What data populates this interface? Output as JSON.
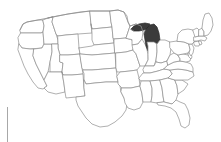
{
  "page": {
    "background_color": "#ffffff"
  },
  "map": {
    "name": "united-states-locator-map",
    "projection_hint": "albers-usa",
    "border_color": "#8e8e8e",
    "state_fill_color": "#ffffff",
    "highlight_fill_color": "#3b3b3b",
    "highlight_border_color": "#2a2a2a",
    "highlighted_states": [
      "Michigan"
    ],
    "highlight_label": "Michigan",
    "states": [
      "Washington",
      "Oregon",
      "California",
      "Nevada",
      "Idaho",
      "Montana",
      "Wyoming",
      "Utah",
      "Arizona",
      "Colorado",
      "New Mexico",
      "North Dakota",
      "South Dakota",
      "Nebraska",
      "Kansas",
      "Oklahoma",
      "Texas",
      "Minnesota",
      "Iowa",
      "Missouri",
      "Arkansas",
      "Louisiana",
      "Wisconsin",
      "Illinois",
      "Michigan",
      "Indiana",
      "Ohio",
      "Kentucky",
      "Tennessee",
      "Mississippi",
      "Alabama",
      "Georgia",
      "Florida",
      "South Carolina",
      "North Carolina",
      "Virginia",
      "West Virginia",
      "Maryland",
      "Delaware",
      "Pennsylvania",
      "New Jersey",
      "New York",
      "Connecticut",
      "Rhode Island",
      "Massachusetts",
      "Vermont",
      "New Hampshire",
      "Maine"
    ]
  },
  "decoration": {
    "side_rule_color": "#a8a8a8",
    "side_rule_name": "left-margin-rule"
  }
}
